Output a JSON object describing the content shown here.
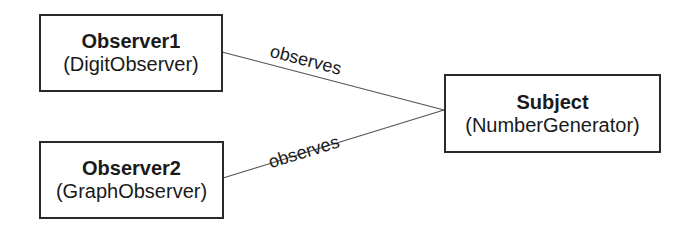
{
  "diagram": {
    "nodes": [
      {
        "id": "observer1",
        "name": "Observer1",
        "class": "(DigitObserver)"
      },
      {
        "id": "observer2",
        "name": "Observer2",
        "class": "(GraphObserver)"
      },
      {
        "id": "subject",
        "name": "Subject",
        "class": "(NumberGenerator)"
      }
    ],
    "edges": [
      {
        "from": "observer1",
        "to": "subject",
        "label": "observes"
      },
      {
        "from": "observer2",
        "to": "subject",
        "label": "observes"
      }
    ],
    "colors": {
      "line": "#555555",
      "border": "#2a2a2a",
      "text": "#1a1a1a"
    }
  }
}
